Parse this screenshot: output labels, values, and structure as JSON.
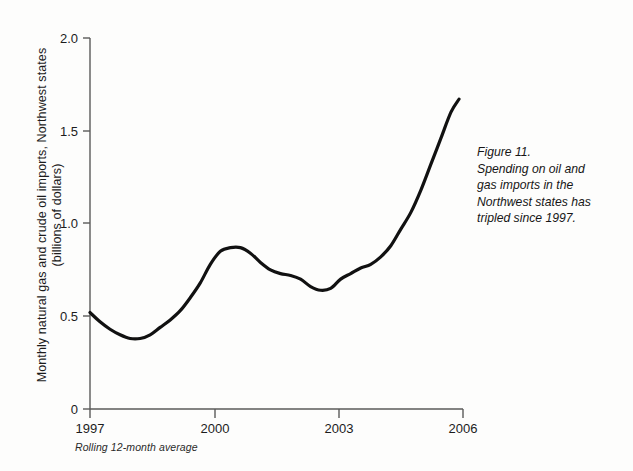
{
  "figure": {
    "caption_lines": [
      "Figure 11.",
      "Spending on oil and",
      "gas imports in the",
      "Northwest states has",
      "tripled since 1997."
    ],
    "footnote": "Rolling 12-month average"
  },
  "chart_data": {
    "type": "line",
    "title": "",
    "subtitle": "",
    "xlabel": "",
    "ylabel": "Monthly natural gas and crude oil imports, Northwest states (billions of dollars)",
    "ylabel_lines": [
      "Monthly natural gas and crude oil imports, Northwest states",
      "(billions of dollars)"
    ],
    "xlim": [
      1997.0,
      2006.3
    ],
    "ylim": [
      0,
      2.0
    ],
    "yticks": [
      0,
      0.5,
      1.0,
      1.5,
      2.0
    ],
    "ytick_labels": [
      "0",
      "0.5",
      "1.0",
      "1.5",
      "2.0"
    ],
    "xticks": [
      1997,
      2000,
      2003,
      2006
    ],
    "xtick_labels": [
      "1997",
      "2000",
      "2003",
      "2006"
    ],
    "grid": false,
    "legend": false,
    "line_color": "#111111",
    "line_width": 3.2,
    "series": [
      {
        "name": "Monthly natural gas and crude oil imports, Northwest states",
        "x": [
          1997.0,
          1997.25,
          1997.5,
          1997.75,
          1998.0,
          1998.25,
          1998.5,
          1998.75,
          1999.0,
          1999.25,
          1999.5,
          1999.75,
          2000.0,
          2000.25,
          2000.5,
          2000.75,
          2001.0,
          2001.25,
          2001.5,
          2001.75,
          2002.0,
          2002.25,
          2002.5,
          2002.75,
          2003.0,
          2003.25,
          2003.5,
          2003.75,
          2004.0,
          2004.25,
          2004.5,
          2004.75,
          2005.0,
          2005.25,
          2005.5,
          2005.75,
          2006.0,
          2006.2
        ],
        "values": [
          0.52,
          0.47,
          0.43,
          0.4,
          0.38,
          0.38,
          0.4,
          0.44,
          0.48,
          0.53,
          0.6,
          0.68,
          0.78,
          0.85,
          0.87,
          0.87,
          0.84,
          0.79,
          0.75,
          0.73,
          0.72,
          0.7,
          0.66,
          0.64,
          0.65,
          0.7,
          0.73,
          0.76,
          0.78,
          0.82,
          0.88,
          0.97,
          1.06,
          1.18,
          1.32,
          1.46,
          1.6,
          1.67
        ]
      }
    ]
  }
}
